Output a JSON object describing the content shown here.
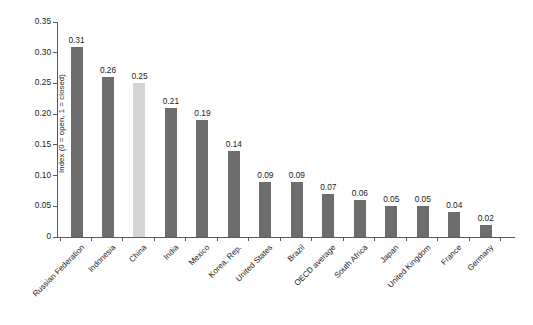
{
  "chart_data": {
    "type": "bar",
    "title": "",
    "subtitle": "",
    "xlabel": "",
    "ylabel": "Index (0 = open, 1 = closed)",
    "ylim": [
      0,
      0.35
    ],
    "grid": false,
    "legend": null,
    "yticks": [
      "0",
      "0.05",
      "0.10",
      "0.15",
      "0.20",
      "0.25",
      "0.30",
      "0.35"
    ],
    "ytick_values": [
      0,
      0.05,
      0.1,
      0.15,
      0.2,
      0.25,
      0.3,
      0.35
    ],
    "categories": [
      "Russian Federation",
      "Indonesia",
      "China",
      "India",
      "Mexico",
      "Korea, Rep.",
      "United States",
      "Brazil",
      "OECD average",
      "South Africa",
      "Japan",
      "United Kingdom",
      "France",
      "Germany"
    ],
    "values": [
      0.31,
      0.26,
      0.25,
      0.21,
      0.19,
      0.14,
      0.09,
      0.09,
      0.07,
      0.06,
      0.05,
      0.05,
      0.04,
      0.02
    ],
    "value_labels": [
      "0.31",
      "0.26",
      "0.25",
      "0.21",
      "0.19",
      "0.14",
      "0.09",
      "0.09",
      "0.07",
      "0.06",
      "0.05",
      "0.05",
      "0.04",
      "0.02"
    ],
    "highlight_index": 2,
    "colors": {
      "bar": "#6d6d6d",
      "bar_highlight": "#d4d4d4",
      "axis": "#5a5a5a",
      "text": "#1a1a1a",
      "background": "#ffffff"
    }
  }
}
